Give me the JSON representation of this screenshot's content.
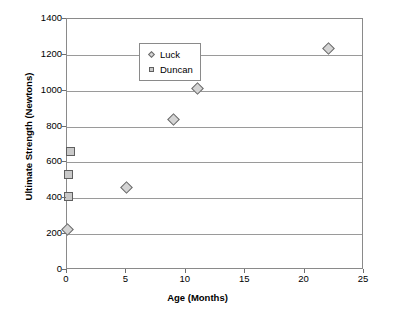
{
  "chart_data": {
    "type": "scatter",
    "title": "",
    "xlabel": "Age (Months)",
    "ylabel": "Ultimate Strength (Newtons)",
    "xlim": [
      0,
      25
    ],
    "ylim": [
      0,
      1400
    ],
    "xticks": [
      0,
      5,
      10,
      15,
      20,
      25
    ],
    "yticks": [
      0,
      200,
      400,
      600,
      800,
      1000,
      1200,
      1400
    ],
    "grid": "horizontal",
    "legend_position": "top-left",
    "series": [
      {
        "name": "Luck",
        "marker": "diamond",
        "color": "#d4d4d4",
        "points": [
          {
            "x": 0,
            "y": 228
          },
          {
            "x": 5,
            "y": 460
          },
          {
            "x": 9,
            "y": 840
          },
          {
            "x": 11,
            "y": 1015
          },
          {
            "x": 22,
            "y": 1235
          }
        ]
      },
      {
        "name": "Duncan",
        "marker": "square",
        "color": "#c9c9c9",
        "points": [
          {
            "x": 0.3,
            "y": 660
          },
          {
            "x": 0.1,
            "y": 535
          },
          {
            "x": 0.1,
            "y": 410
          }
        ]
      }
    ]
  },
  "legend": {
    "items": [
      {
        "label": "Luck"
      },
      {
        "label": "Duncan"
      }
    ]
  }
}
